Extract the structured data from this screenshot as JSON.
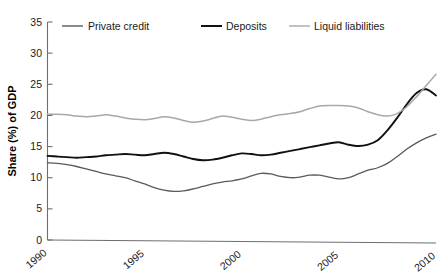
{
  "chart_data": {
    "type": "line",
    "title": "",
    "subtitle": "",
    "xlabel": "",
    "ylabel": "Share (%) of GDP",
    "xlim": [
      1990,
      2010
    ],
    "ylim": [
      0,
      35
    ],
    "yticks": [
      0,
      5,
      10,
      15,
      20,
      25,
      30,
      35
    ],
    "ytick_labels": [
      "0",
      "5",
      "10",
      "15",
      "20",
      "25",
      "30",
      "35"
    ],
    "xticks": [
      1990,
      1995,
      2000,
      2005,
      2010
    ],
    "xtick_labels": [
      "1990",
      "1995",
      "2000",
      "2005",
      "2010"
    ],
    "grid": false,
    "legend_position": "top",
    "x": [
      1990,
      1990.5,
      1991,
      1991.5,
      1992,
      1992.5,
      1993,
      1993.5,
      1994,
      1994.5,
      1995,
      1995.5,
      1996,
      1996.5,
      1997,
      1997.5,
      1998,
      1998.5,
      1999,
      1999.5,
      2000,
      2000.5,
      2001,
      2001.5,
      2002,
      2002.5,
      2003,
      2003.5,
      2004,
      2004.5,
      2005,
      2005.5,
      2006,
      2006.5,
      2007,
      2007.5,
      2008,
      2008.5,
      2009,
      2009.5,
      2010
    ],
    "series": [
      {
        "name": "Private credit",
        "color": "#5a5a5a",
        "width": 1.3,
        "values": [
          12.4,
          12.3,
          12.1,
          11.8,
          11.4,
          11.0,
          10.6,
          10.3,
          10.0,
          9.5,
          9.0,
          8.4,
          8.0,
          7.8,
          7.9,
          8.2,
          8.6,
          9.0,
          9.3,
          9.5,
          9.8,
          10.3,
          10.7,
          10.6,
          10.2,
          10.0,
          10.1,
          10.4,
          10.4,
          10.1,
          9.8,
          10.0,
          10.6,
          11.2,
          11.6,
          12.3,
          13.4,
          14.6,
          15.6,
          16.4,
          17.0
        ]
      },
      {
        "name": "Deposits",
        "color": "#111111",
        "width": 1.9,
        "values": [
          13.5,
          13.4,
          13.3,
          13.2,
          13.3,
          13.4,
          13.6,
          13.7,
          13.8,
          13.7,
          13.6,
          13.8,
          14.0,
          13.8,
          13.4,
          13.0,
          12.8,
          12.9,
          13.2,
          13.6,
          13.9,
          13.8,
          13.6,
          13.7,
          14.0,
          14.3,
          14.6,
          14.9,
          15.2,
          15.5,
          15.7,
          15.3,
          15.1,
          15.3,
          16.0,
          17.6,
          19.6,
          21.8,
          23.6,
          24.2,
          23.2
        ]
      },
      {
        "name": "Liquid liabilities",
        "color": "#a8a8a8",
        "width": 1.5,
        "values": [
          20.2,
          20.2,
          20.1,
          19.9,
          19.8,
          19.9,
          20.1,
          19.9,
          19.6,
          19.4,
          19.3,
          19.5,
          19.8,
          19.6,
          19.2,
          18.9,
          19.1,
          19.5,
          19.9,
          19.7,
          19.4,
          19.2,
          19.4,
          19.8,
          20.1,
          20.3,
          20.6,
          21.1,
          21.5,
          21.6,
          21.6,
          21.5,
          21.2,
          20.6,
          20.1,
          19.9,
          20.3,
          21.4,
          23.0,
          24.8,
          26.6
        ]
      }
    ],
    "legend": [
      {
        "label": "Private credit",
        "color": "#5a5a5a"
      },
      {
        "label": "Deposits",
        "color": "#111111"
      },
      {
        "label": "Liquid liabilities",
        "color": "#a8a8a8"
      }
    ]
  },
  "axes": {
    "ylabel": "Share (%) of GDP",
    "ytick_labels": [
      "0",
      "5",
      "10",
      "15",
      "20",
      "25",
      "30",
      "35"
    ],
    "xtick_labels": [
      "1990",
      "1995",
      "2000",
      "2005",
      "2010"
    ]
  }
}
